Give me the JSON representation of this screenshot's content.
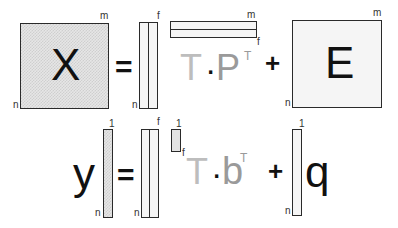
{
  "row1": {
    "lhs": {
      "symbol": "X",
      "dim_cols": "m",
      "dim_rows": "n"
    },
    "equals": "=",
    "scores": {
      "dim_cols": "f",
      "dim_rows": "n"
    },
    "loadings": {
      "dim_cols": "m",
      "dim_rows": "f"
    },
    "product": {
      "left": "T",
      "dot": "·",
      "right": "P",
      "sup": "T"
    },
    "plus": "+",
    "residual": {
      "symbol": "E",
      "dim_cols": "m",
      "dim_rows": "n"
    }
  },
  "row2": {
    "lhs": {
      "symbol": "y",
      "dim_cols": "1",
      "dim_rows": "n"
    },
    "equals": "=",
    "scores": {
      "dim_cols": "f",
      "dim_rows": "n"
    },
    "coefficients": {
      "dim_cols": "1",
      "dim_rows": "f"
    },
    "product": {
      "left": "T",
      "dot": "·",
      "right": "b",
      "sup": "T"
    },
    "plus": "+",
    "residual": {
      "symbol": "q",
      "dim_cols": "1",
      "dim_rows": "n"
    }
  },
  "colors": {
    "stroke": "#2a2a2a",
    "T_symbol": "#bdbdbd",
    "P_b_symbol": "#9a9a9a",
    "fill_light": "#f5f5f5",
    "fill_mid": "#e3e3e3"
  }
}
